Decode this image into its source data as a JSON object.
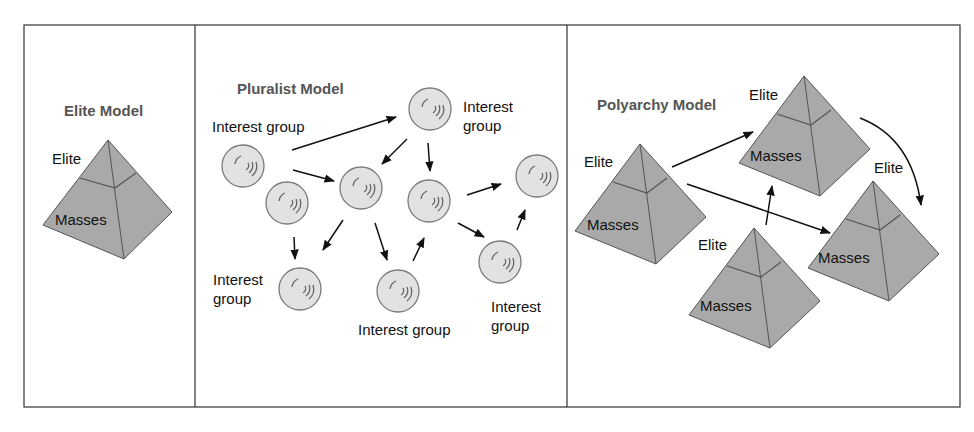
{
  "panels": [
    {
      "id": "elite",
      "title": "Elite Model",
      "pyramid": {
        "top_label": "Elite",
        "bottom_label": "Masses"
      }
    },
    {
      "id": "pluralist",
      "title": "Pluralist Model",
      "nodes": [
        {
          "label": "Interest group"
        },
        {
          "label_line1": "Interest",
          "label_line2": "group"
        },
        {
          "label_line1": "Interest",
          "label_line2": "group"
        },
        {
          "label": "Interest group"
        },
        {
          "label_line1": "Interest",
          "label_line2": "group"
        }
      ]
    },
    {
      "id": "polyarchy",
      "title": "Polyarchy Model",
      "pyramids": [
        {
          "top_label": "Elite",
          "bottom_label": "Masses"
        },
        {
          "top_label": "Elite",
          "bottom_label": "Masses"
        },
        {
          "top_label": "Elite",
          "bottom_label": "Masses"
        },
        {
          "top_label": "Elite",
          "bottom_label": "Masses"
        }
      ]
    }
  ],
  "colors": {
    "pyramid_fill": "#a9a9a9",
    "pyramid_stroke": "#555555",
    "circle_fill": "#e2e2e2",
    "circle_stroke": "#7a7a7a",
    "border": "#333333",
    "title_text": "#555555"
  }
}
